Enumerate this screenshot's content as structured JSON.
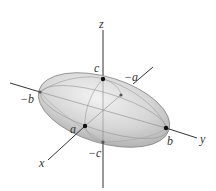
{
  "figure": {
    "type": "ellipsoid",
    "axes": {
      "x_label": "x",
      "y_label": "y",
      "z_label": "z"
    },
    "intercepts": {
      "pos_a": "a",
      "neg_a": "−a",
      "pos_b": "b",
      "neg_b": "−b",
      "pos_c": "c",
      "neg_c": "−c"
    },
    "colors": {
      "surface_light": "#ececec",
      "surface_mid": "#cfcfcf",
      "surface_dark": "#a9a9a9",
      "outline": "#8a8a8a",
      "axis": "#333333",
      "point": "#111111",
      "hidden_point": "#555555"
    }
  }
}
